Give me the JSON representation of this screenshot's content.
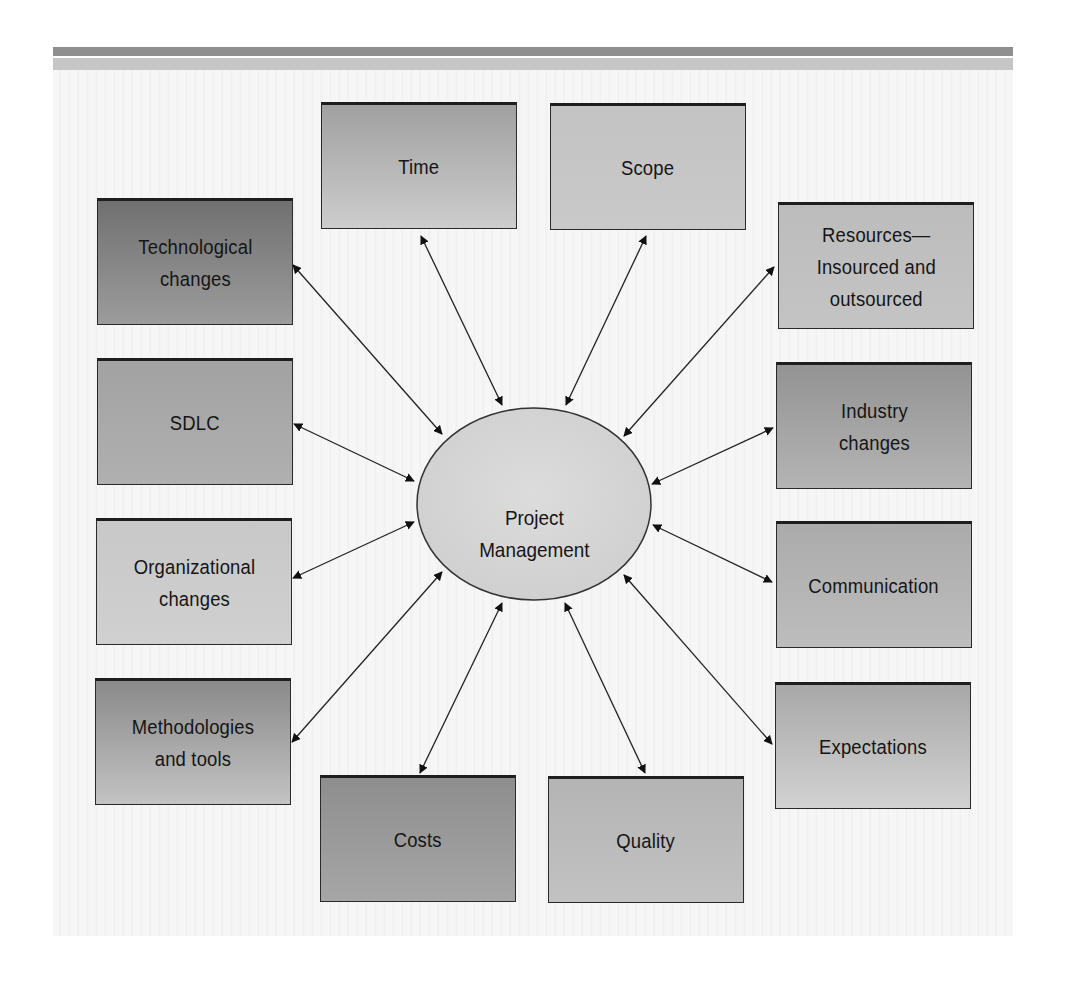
{
  "diagram": {
    "center": {
      "label": "Project\nManagement",
      "fill": "#d4d4d4"
    },
    "nodes": [
      {
        "id": "time",
        "label": "Time",
        "x": 321,
        "y": 102,
        "top": "#a0a0a0",
        "bottom": "#cdcdcd"
      },
      {
        "id": "scope",
        "label": "Scope",
        "x": 550,
        "y": 103,
        "top": "#c3c3c3",
        "bottom": "#c9c9c9"
      },
      {
        "id": "technological-changes",
        "label": "Technological\nchanges",
        "x": 97,
        "y": 198,
        "top": "#707070",
        "bottom": "#9c9c9c"
      },
      {
        "id": "resources",
        "label": "Resources—\nInsourced and\noutsourced",
        "x": 778,
        "y": 202,
        "top": "#bcbcbc",
        "bottom": "#c4c4c4"
      },
      {
        "id": "sdlc",
        "label": "SDLC",
        "x": 97,
        "y": 358,
        "top": "#a2a2a2",
        "bottom": "#b0b0b0"
      },
      {
        "id": "industry-changes",
        "label": "Industry\nchanges",
        "x": 776,
        "y": 362,
        "top": "#939393",
        "bottom": "#b4b4b4"
      },
      {
        "id": "organizational-changes",
        "label": "Organizational\nchanges",
        "x": 96,
        "y": 518,
        "top": "#c8c8c8",
        "bottom": "#d0d0d0"
      },
      {
        "id": "communication",
        "label": "Communication",
        "x": 776,
        "y": 521,
        "top": "#ababab",
        "bottom": "#bdbdbd"
      },
      {
        "id": "methodologies-and-tools",
        "label": "Methodologies\nand tools",
        "x": 95,
        "y": 678,
        "top": "#8a8a8a",
        "bottom": "#c3c3c3"
      },
      {
        "id": "expectations",
        "label": "Expectations",
        "x": 775,
        "y": 682,
        "top": "#a8a8a8",
        "bottom": "#d2d2d2"
      },
      {
        "id": "costs",
        "label": "Costs",
        "x": 320,
        "y": 775,
        "top": "#8e8e8e",
        "bottom": "#a6a6a6"
      },
      {
        "id": "quality",
        "label": "Quality",
        "x": 548,
        "y": 776,
        "top": "#b4b4b4",
        "bottom": "#c2c2c2"
      }
    ],
    "edges": [
      {
        "to": "time",
        "x1": 421,
        "y1": 236,
        "x2": 502,
        "y2": 405
      },
      {
        "to": "scope",
        "x1": 646,
        "y1": 236,
        "x2": 566,
        "y2": 405
      },
      {
        "to": "technological-changes",
        "x1": 293,
        "y1": 265,
        "x2": 442,
        "y2": 434
      },
      {
        "to": "resources",
        "x1": 774,
        "y1": 267,
        "x2": 624,
        "y2": 436
      },
      {
        "to": "sdlc",
        "x1": 294,
        "y1": 424,
        "x2": 414,
        "y2": 481
      },
      {
        "to": "industry-changes",
        "x1": 773,
        "y1": 428,
        "x2": 652,
        "y2": 484
      },
      {
        "to": "organizational-changes",
        "x1": 293,
        "y1": 578,
        "x2": 414,
        "y2": 522
      },
      {
        "to": "communication",
        "x1": 772,
        "y1": 582,
        "x2": 653,
        "y2": 525
      },
      {
        "to": "methodologies-and-tools",
        "x1": 292,
        "y1": 742,
        "x2": 442,
        "y2": 572
      },
      {
        "to": "expectations",
        "x1": 772,
        "y1": 744,
        "x2": 624,
        "y2": 575
      },
      {
        "to": "costs",
        "x1": 420,
        "y1": 773,
        "x2": 502,
        "y2": 603
      },
      {
        "to": "quality",
        "x1": 645,
        "y1": 773,
        "x2": 565,
        "y2": 603
      }
    ]
  }
}
